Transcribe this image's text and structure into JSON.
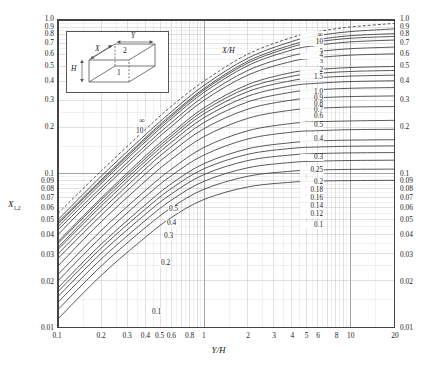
{
  "chart_data": {
    "type": "line",
    "title": "",
    "xlabel": "Y/H",
    "ylabel": "X1,2",
    "ylabel_base": "X",
    "ylabel_sub": "1,2",
    "xscale": "log",
    "yscale": "log",
    "xlim": [
      0.1,
      20
    ],
    "ylim": [
      0.01,
      1.0
    ],
    "grid": true,
    "grid_style": "log-log minor grid",
    "legend": "none",
    "parameter_name": "X/H",
    "x_ticks": [
      "0.1",
      "0.2",
      "0.3",
      "0.4",
      "0.5",
      "0.6",
      "0.8",
      "1",
      "2",
      "3",
      "4",
      "5",
      "6",
      "8",
      "10",
      "20"
    ],
    "x_tick_values": [
      0.1,
      0.2,
      0.3,
      0.4,
      0.5,
      0.6,
      0.8,
      1,
      2,
      3,
      4,
      5,
      6,
      8,
      10,
      20
    ],
    "y_ticks_left": [
      "1.0",
      "0.9",
      "0.8",
      "0.7",
      "0.6",
      "0.5",
      "0.4",
      "0.3",
      "0.2",
      "0.1",
      "0.09",
      "0.08",
      "0.07",
      "0.06",
      "0.05",
      "0.04",
      "0.03",
      "0.02",
      "0.01"
    ],
    "y_ticks_right": [
      "1.0",
      "0.9",
      "0.8",
      "0.7",
      "0.6",
      "0.5",
      "0.4",
      "0.3",
      "0.2",
      "0.1",
      "0.09",
      "0.08",
      "0.07",
      "0.06",
      "0.05",
      "0.04",
      "0.03",
      "0.02",
      "0.01"
    ],
    "y_tick_values": [
      1.0,
      0.9,
      0.8,
      0.7,
      0.6,
      0.5,
      0.4,
      0.3,
      0.2,
      0.1,
      0.09,
      0.08,
      0.07,
      0.06,
      0.05,
      0.04,
      0.03,
      0.02,
      0.01
    ],
    "center_ladder_label": "X/H",
    "center_ladder": [
      "∞",
      "10",
      "5",
      "4",
      "3",
      "2",
      "1.5",
      "1.0",
      "0.9",
      "0.8",
      "0.7",
      "0.6",
      "0.5",
      "0.4",
      "0.3",
      "0.25",
      "0.2",
      "0.18",
      "0.16",
      "0.14",
      "0.12",
      "0.1"
    ],
    "left_annotations": [
      "∞",
      "10",
      "0.5",
      "0.4",
      "0.3",
      "0.2",
      "0.1"
    ],
    "series": [
      {
        "name": "∞",
        "x": [
          0.1,
          0.2,
          0.4,
          0.6,
          1,
          2,
          4,
          6,
          10,
          20
        ],
        "values": [
          0.055,
          0.105,
          0.195,
          0.275,
          0.4,
          0.6,
          0.77,
          0.84,
          0.9,
          0.95
        ]
      },
      {
        "name": "10",
        "x": [
          0.1,
          0.2,
          0.4,
          0.6,
          1,
          2,
          4,
          6,
          10,
          20
        ],
        "values": [
          0.05,
          0.097,
          0.18,
          0.253,
          0.375,
          0.565,
          0.725,
          0.79,
          0.84,
          0.875
        ]
      },
      {
        "name": "5",
        "x": [
          0.1,
          0.2,
          0.4,
          0.6,
          1,
          2,
          4,
          6,
          10,
          20
        ],
        "values": [
          0.048,
          0.092,
          0.172,
          0.242,
          0.358,
          0.54,
          0.69,
          0.745,
          0.79,
          0.815
        ]
      },
      {
        "name": "4",
        "x": [
          0.1,
          0.2,
          0.4,
          0.6,
          1,
          2,
          4,
          6,
          10,
          20
        ],
        "values": [
          0.047,
          0.09,
          0.168,
          0.236,
          0.35,
          0.525,
          0.668,
          0.72,
          0.76,
          0.782
        ]
      },
      {
        "name": "3",
        "x": [
          0.1,
          0.2,
          0.4,
          0.6,
          1,
          2,
          4,
          6,
          10,
          20
        ],
        "values": [
          0.045,
          0.087,
          0.162,
          0.228,
          0.338,
          0.505,
          0.638,
          0.684,
          0.72,
          0.74
        ]
      },
      {
        "name": "2",
        "x": [
          0.1,
          0.2,
          0.4,
          0.6,
          1,
          2,
          4,
          6,
          10,
          20
        ],
        "values": [
          0.043,
          0.082,
          0.153,
          0.215,
          0.318,
          0.47,
          0.585,
          0.622,
          0.65,
          0.666
        ]
      },
      {
        "name": "1.5",
        "x": [
          0.1,
          0.2,
          0.4,
          0.6,
          1,
          2,
          4,
          6,
          10,
          20
        ],
        "values": [
          0.04,
          0.078,
          0.145,
          0.203,
          0.3,
          0.438,
          0.538,
          0.568,
          0.59,
          0.602
        ]
      },
      {
        "name": "1.0",
        "x": [
          0.1,
          0.2,
          0.4,
          0.6,
          1,
          2,
          4,
          6,
          10,
          20
        ],
        "values": [
          0.036,
          0.07,
          0.131,
          0.183,
          0.268,
          0.38,
          0.455,
          0.475,
          0.49,
          0.498
        ]
      },
      {
        "name": "0.9",
        "x": [
          0.1,
          0.2,
          0.4,
          0.6,
          1,
          2,
          4,
          6,
          10,
          20
        ],
        "values": [
          0.035,
          0.068,
          0.126,
          0.176,
          0.257,
          0.362,
          0.43,
          0.449,
          0.462,
          0.469
        ]
      },
      {
        "name": "0.8",
        "x": [
          0.1,
          0.2,
          0.4,
          0.6,
          1,
          2,
          4,
          6,
          10,
          20
        ],
        "values": [
          0.033,
          0.065,
          0.121,
          0.169,
          0.245,
          0.342,
          0.403,
          0.42,
          0.431,
          0.437
        ]
      },
      {
        "name": "0.7",
        "x": [
          0.1,
          0.2,
          0.4,
          0.6,
          1,
          2,
          4,
          6,
          10,
          20
        ],
        "values": [
          0.032,
          0.062,
          0.115,
          0.16,
          0.231,
          0.319,
          0.373,
          0.387,
          0.397,
          0.402
        ]
      },
      {
        "name": "0.6",
        "x": [
          0.1,
          0.2,
          0.4,
          0.6,
          1,
          2,
          4,
          6,
          10,
          20
        ],
        "values": [
          0.03,
          0.058,
          0.108,
          0.15,
          0.215,
          0.293,
          0.339,
          0.351,
          0.359,
          0.363
        ]
      },
      {
        "name": "0.5",
        "x": [
          0.1,
          0.2,
          0.4,
          0.6,
          1,
          2,
          4,
          6,
          10,
          20
        ],
        "values": [
          0.028,
          0.054,
          0.1,
          0.138,
          0.196,
          0.263,
          0.301,
          0.311,
          0.317,
          0.32
        ]
      },
      {
        "name": "0.4",
        "x": [
          0.1,
          0.2,
          0.4,
          0.6,
          1,
          2,
          4,
          6,
          10,
          20
        ],
        "values": [
          0.025,
          0.049,
          0.09,
          0.124,
          0.174,
          0.229,
          0.259,
          0.266,
          0.271,
          0.273
        ]
      },
      {
        "name": "0.3",
        "x": [
          0.1,
          0.2,
          0.4,
          0.6,
          1,
          2,
          4,
          6,
          10,
          20
        ],
        "values": [
          0.022,
          0.043,
          0.078,
          0.107,
          0.148,
          0.19,
          0.212,
          0.217,
          0.22,
          0.222
        ]
      },
      {
        "name": "0.25",
        "x": [
          0.1,
          0.2,
          0.4,
          0.6,
          1,
          2,
          4,
          6,
          10,
          20
        ],
        "values": [
          0.02,
          0.039,
          0.071,
          0.097,
          0.132,
          0.168,
          0.186,
          0.19,
          0.193,
          0.194
        ]
      },
      {
        "name": "0.2",
        "x": [
          0.1,
          0.2,
          0.4,
          0.6,
          1,
          2,
          4,
          6,
          10,
          20
        ],
        "values": [
          0.018,
          0.035,
          0.063,
          0.086,
          0.116,
          0.145,
          0.159,
          0.163,
          0.165,
          0.166
        ]
      },
      {
        "name": "0.18",
        "x": [
          0.1,
          0.2,
          0.4,
          0.6,
          1,
          2,
          4,
          6,
          10,
          20
        ],
        "values": [
          0.017,
          0.033,
          0.059,
          0.08,
          0.1075,
          0.1335,
          0.1458,
          0.1488,
          0.1505,
          0.1513
        ]
      },
      {
        "name": "0.16",
        "x": [
          0.1,
          0.2,
          0.4,
          0.6,
          1,
          2,
          4,
          6,
          10,
          20
        ],
        "values": [
          0.0158,
          0.0306,
          0.0546,
          0.0738,
          0.0985,
          0.1215,
          0.1322,
          0.1348,
          0.1362,
          0.1369
        ]
      },
      {
        "name": "0.14",
        "x": [
          0.1,
          0.2,
          0.4,
          0.6,
          1,
          2,
          4,
          6,
          10,
          20
        ],
        "values": [
          0.0145,
          0.028,
          0.0498,
          0.0672,
          0.089,
          0.109,
          0.1181,
          0.1203,
          0.1215,
          0.1221
        ]
      },
      {
        "name": "0.12",
        "x": [
          0.1,
          0.2,
          0.4,
          0.6,
          1,
          2,
          4,
          6,
          10,
          20
        ],
        "values": [
          0.013,
          0.0252,
          0.0447,
          0.06,
          0.079,
          0.096,
          0.1036,
          0.1054,
          0.1064,
          0.1068
        ]
      },
      {
        "name": "0.1",
        "x": [
          0.1,
          0.2,
          0.4,
          0.6,
          1,
          2,
          4,
          6,
          10,
          20
        ],
        "values": [
          0.0113,
          0.0219,
          0.0387,
          0.0518,
          0.0678,
          0.0818,
          0.0878,
          0.0892,
          0.0899,
          0.0903
        ]
      }
    ]
  },
  "inset": {
    "name": "perpendicular-rectangles-diagram",
    "label_x": "X",
    "label_y": "Y",
    "label_h": "H",
    "face_1": "1",
    "face_2": "2"
  },
  "colors": {
    "curve": "#3a3a3a",
    "grid_minor": "#b9b9b9",
    "grid_major": "#8a8a8a",
    "frame": "#444444",
    "background": "#ffffff",
    "text": "#1a1a1a"
  }
}
